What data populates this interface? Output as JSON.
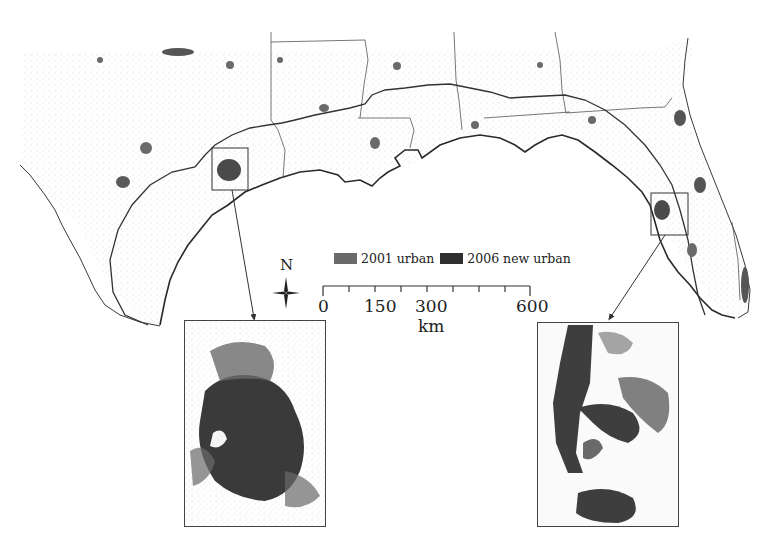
{
  "figure": {
    "type": "thematic-map",
    "region": "U.S. Gulf Coast (Texas to Florida)",
    "colors": {
      "urban_2001": "#6a6a6a",
      "new_urban_2006": "#2e2e2e",
      "land_speckle": "#b5b5b5",
      "boundary": "#3a3a3a",
      "background": "#ffffff"
    }
  },
  "legend": {
    "items": [
      {
        "label": "2001 urban",
        "color": "#6a6a6a"
      },
      {
        "label": "2006 new urban",
        "color": "#2e2e2e"
      }
    ]
  },
  "north_arrow": {
    "label": "N"
  },
  "scale_bar": {
    "ticks": [
      "0",
      "150",
      "300",
      "600"
    ],
    "unit": "km"
  },
  "insets": [
    {
      "name": "houston-inset",
      "location": "Houston, TX area"
    },
    {
      "name": "tampa-inset",
      "location": "Tampa Bay, FL area"
    }
  ]
}
